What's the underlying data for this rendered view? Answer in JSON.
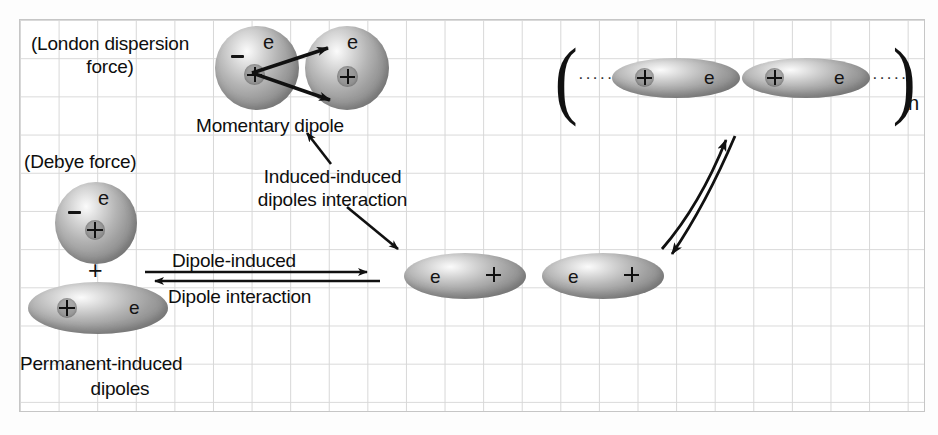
{
  "figure": {
    "background": "#ffffff",
    "grid_color": "#d7d7d7",
    "ink_color": "#111111",
    "atom_fill": "#9d9d9d"
  },
  "labels": {
    "london": "(London dispersion\nforce)",
    "london_line1": "(London dispersion",
    "london_line2": "force)",
    "momentary_dipole": "Momentary dipole",
    "debye": "(Debye force)",
    "induced_induced_line1": "Induced-induced",
    "induced_induced_line2": "dipoles interaction",
    "dipole_induced": "Dipole-induced",
    "dipole_interaction": "Dipole interaction",
    "permanent_line1": "Permanent-induced",
    "permanent_line2": "dipoles",
    "plus_sign": "+",
    "subscript_n": "n",
    "paren_open": "(",
    "paren_close": ")",
    "leading_dots": "·····",
    "trailing_dots": "·····"
  },
  "symbols": {
    "electron": "e",
    "nucleus": "+",
    "negative": "−"
  },
  "groups": {
    "momentary_dipole_pair": {
      "caption": "Momentary dipole",
      "atoms": [
        {
          "shape": "sphere",
          "electron": "e",
          "charge": "+",
          "negative": "−"
        },
        {
          "shape": "sphere",
          "electron": "e",
          "charge": "+"
        }
      ]
    },
    "polymer_chain": {
      "bracketed": true,
      "subscript": "n",
      "atoms": [
        {
          "shape": "ellipse",
          "charge": "+",
          "electron": "e"
        },
        {
          "shape": "ellipse",
          "charge": "+",
          "electron": "e"
        }
      ]
    },
    "permanent_induced_dipoles": {
      "caption_line1": "Permanent-induced",
      "caption_line2": "dipoles",
      "atoms": [
        {
          "shape": "sphere",
          "electron": "e",
          "charge": "+",
          "negative": "−"
        },
        {
          "shape": "ellipse",
          "charge": "+",
          "electron": "e"
        }
      ],
      "joiner": "+"
    },
    "induced_pair": {
      "atoms": [
        {
          "shape": "ellipse",
          "electron": "e",
          "charge": "+"
        },
        {
          "shape": "ellipse",
          "electron": "e",
          "charge": "+"
        }
      ]
    }
  },
  "arrows": {
    "momentary_upper": "arrow from nucleus of left sphere to upper right sphere",
    "momentary_lower": "arrow from nucleus of left sphere to lower right sphere",
    "callout_up": "arrow pointing up-left to Momentary dipole",
    "callout_down": "arrow pointing down-right to induced pair",
    "equilibrium_forward": "Dipole-induced",
    "equilibrium_reverse": "Dipole interaction",
    "curved_up": "curved arrow up-right to polymer chain",
    "curved_down": "curved arrow down-left from polymer chain"
  }
}
